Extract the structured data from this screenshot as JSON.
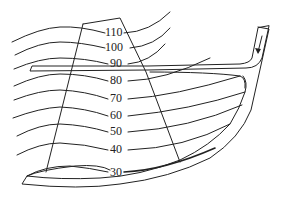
{
  "diagram": {
    "type": "contour-overlay",
    "contour_labels": [
      "110",
      "100",
      "90",
      "80",
      "70",
      "60",
      "50",
      "40",
      "30"
    ],
    "contours": [
      {
        "value": "110",
        "label_x": 109,
        "label_y": 36
      },
      {
        "value": "100",
        "label_x": 109,
        "label_y": 51
      },
      {
        "value": "90",
        "label_x": 112,
        "label_y": 67
      },
      {
        "value": "80",
        "label_x": 112,
        "label_y": 84
      },
      {
        "value": "70",
        "label_x": 112,
        "label_y": 102
      },
      {
        "value": "60",
        "label_x": 112,
        "label_y": 119
      },
      {
        "value": "50",
        "label_x": 112,
        "label_y": 135
      },
      {
        "value": "40",
        "label_x": 112,
        "label_y": 153
      },
      {
        "value": "30",
        "label_x": 112,
        "label_y": 175
      }
    ],
    "inlet_arrow": "down-arrow",
    "colors": {
      "line": "#222222",
      "background": "#ffffff"
    }
  }
}
